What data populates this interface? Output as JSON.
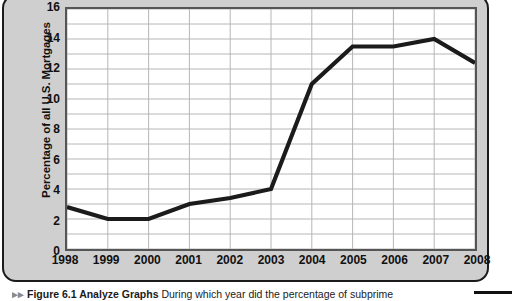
{
  "figure": {
    "y_axis_title": "Percentage of all U.S. Mortgages",
    "caption_marker": "▸▸",
    "caption_title": "Figure 6.1 Analyze Graphs",
    "caption_text": "During which year did the percentage of subprime"
  },
  "chart_data": {
    "type": "line",
    "title": "",
    "xlabel": "",
    "ylabel": "Percentage of all U.S. Mortgages",
    "categories": [
      "1998",
      "1999",
      "2000",
      "2001",
      "2002",
      "2003",
      "2004",
      "2005",
      "2006",
      "2007",
      "2008"
    ],
    "values": [
      2.8,
      2.0,
      2.0,
      3.0,
      3.4,
      4.0,
      11.0,
      13.5,
      13.5,
      14.0,
      12.4
    ],
    "series": [
      {
        "name": "Subprime share of U.S. mortgages",
        "values": [
          2.8,
          2.0,
          2.0,
          3.0,
          3.4,
          4.0,
          11.0,
          13.5,
          13.5,
          14.0,
          12.4
        ]
      }
    ],
    "ylim": [
      0,
      16
    ],
    "yticks": [
      0,
      2,
      4,
      6,
      8,
      10,
      12,
      14,
      16
    ],
    "y_gridline_step": 1,
    "grid": true,
    "legend": "none",
    "line_color": "#1b1b1b",
    "grid_color": "#b5b5b5",
    "plot_background": "#ffffff",
    "panel_background": "#cfcfcf"
  }
}
